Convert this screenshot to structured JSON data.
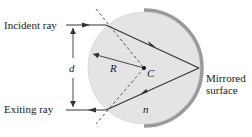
{
  "diagram": {
    "labels": {
      "incident": "Incident ray",
      "exiting": "Exiting ray",
      "distance": "d",
      "radius": "R",
      "center": "C",
      "index": "n",
      "mirror_line1": "Mirrored",
      "mirror_line2": "surface"
    },
    "colors": {
      "sphere_fill": "#e4e4e4",
      "mirror": "#9a9a9a",
      "ray": "#333333",
      "dashed": "#444444"
    }
  }
}
